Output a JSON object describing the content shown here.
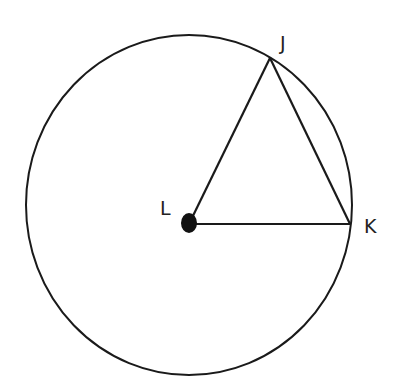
{
  "diagram": {
    "type": "circle-geometry",
    "circle": {
      "center_label": "L",
      "cx": 189,
      "cy": 205,
      "rx": 163,
      "ry": 170
    },
    "points": [
      {
        "label": "J",
        "x": 270,
        "y": 58,
        "on_circle": true
      },
      {
        "label": "K",
        "x": 350,
        "y": 224,
        "on_circle": true
      },
      {
        "label": "L",
        "x": 189,
        "y": 224,
        "is_center": true
      }
    ],
    "segments": [
      {
        "from": "L",
        "to": "J"
      },
      {
        "from": "J",
        "to": "K"
      },
      {
        "from": "L",
        "to": "K"
      }
    ],
    "labels": {
      "J": "J",
      "K": "K",
      "L": "L"
    },
    "colors": {
      "stroke": "#1a1a1a",
      "background": "#ffffff"
    }
  }
}
